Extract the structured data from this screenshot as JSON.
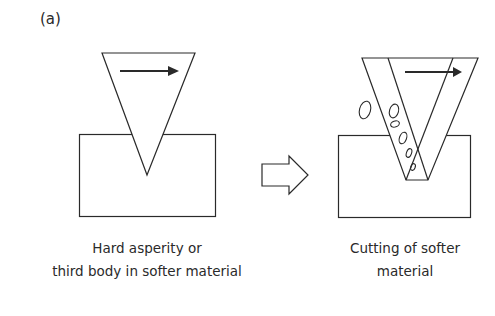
{
  "figure": {
    "panel_label": "(a)",
    "left_stage": {
      "caption_line1": "Hard asperity or",
      "caption_line2": "third body in softer material",
      "elements": [
        "hard-asperity-triangle",
        "sliding-direction-arrow",
        "softer-material-block"
      ]
    },
    "transition": {
      "icon": "outline-right-arrow"
    },
    "right_stage": {
      "caption_line1": "Cutting of softer",
      "caption_line2": "material",
      "elements": [
        "moving-asperity-triangle",
        "sliding-direction-arrow",
        "softer-material-block",
        "wear-debris-particles"
      ]
    },
    "colors": {
      "stroke": "#2a2a2a",
      "background": "#ffffff"
    }
  }
}
